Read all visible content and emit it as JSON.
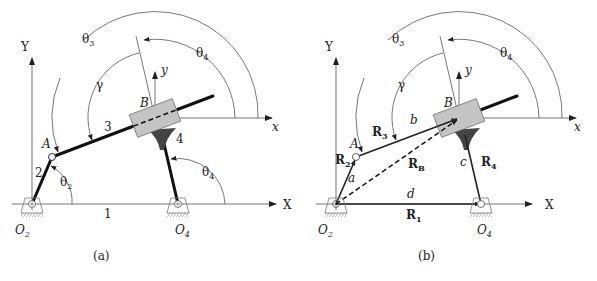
{
  "figure": {
    "panel_a": {
      "caption": "(a)",
      "axes": {
        "X": "X",
        "Y": "Y",
        "x": "x",
        "y": "y"
      },
      "points": {
        "O2": "O",
        "O2_sub": "2",
        "O4": "O",
        "O4_sub": "4",
        "A": "A",
        "B": "B"
      },
      "links": {
        "ground": "1",
        "crank": "2",
        "coupler": "3",
        "rocker": "4"
      },
      "angles": {
        "theta2": "θ",
        "theta2_sub": "2",
        "theta3": "θ",
        "theta3_sub": "3",
        "theta4_top": "θ",
        "theta4_top_sub": "4",
        "theta4_bottom": "θ",
        "theta4_bottom_sub": "4",
        "gamma": "γ"
      }
    },
    "panel_b": {
      "caption": "(b)",
      "axes": {
        "X": "X",
        "Y": "Y",
        "x": "x",
        "y": "y"
      },
      "points": {
        "O2": "O",
        "O2_sub": "2",
        "O4": "O",
        "O4_sub": "4",
        "A": "A",
        "B": "B"
      },
      "vectors": {
        "R1": "R",
        "R1_sub": "1",
        "R2": "R",
        "R2_sub": "2",
        "R3": "R",
        "R3_sub": "3",
        "R4": "R",
        "R4_sub": "4",
        "RB": "R",
        "RB_sub": "B"
      },
      "lengths": {
        "a": "a",
        "b": "b",
        "c": "c",
        "d": "d"
      },
      "angles": {
        "theta3": "θ",
        "theta3_sub": "3",
        "theta4": "θ",
        "theta4_sub": "4",
        "gamma": "γ"
      }
    }
  }
}
